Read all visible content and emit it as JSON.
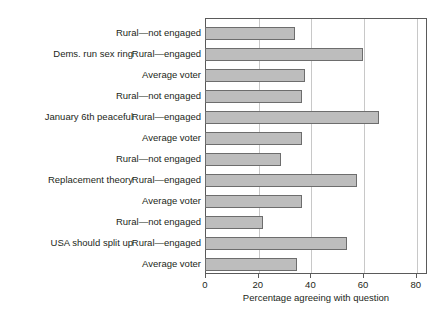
{
  "chart_data": {
    "type": "bar",
    "orientation": "horizontal",
    "title": "",
    "xlabel": "Percentage agreeing with question",
    "ylabel": "",
    "xlim": [
      0,
      84
    ],
    "xticks": [
      0,
      20,
      40,
      60,
      80
    ],
    "xtick_labels": [
      "0",
      "20",
      "40",
      "60",
      "80"
    ],
    "grid": "vertical",
    "legend": "none",
    "group_label_order": "top-to-bottom",
    "categories": [
      "Dems. run sex ring",
      "January 6th peaceful",
      "Replacement theory",
      "USA should split up"
    ],
    "subcategories": [
      "Rural—not engaged",
      "Rural—engaged",
      "Average voter"
    ],
    "groups": [
      {
        "label": "Dems. run sex ring",
        "bars": [
          {
            "label": "Rural—not engaged",
            "value": 34
          },
          {
            "label": "Rural—engaged",
            "value": 60
          },
          {
            "label": "Average voter",
            "value": 38
          }
        ]
      },
      {
        "label": "January 6th peaceful",
        "bars": [
          {
            "label": "Rural—not engaged",
            "value": 37
          },
          {
            "label": "Rural—engaged",
            "value": 66
          },
          {
            "label": "Average voter",
            "value": 37
          }
        ]
      },
      {
        "label": "Replacement theory",
        "bars": [
          {
            "label": "Rural—not engaged",
            "value": 29
          },
          {
            "label": "Rural—engaged",
            "value": 57.5
          },
          {
            "label": "Average voter",
            "value": 37
          }
        ]
      },
      {
        "label": "USA should split up",
        "bars": [
          {
            "label": "Rural—not engaged",
            "value": 22
          },
          {
            "label": "Rural—engaged",
            "value": 54
          },
          {
            "label": "Average voter",
            "value": 35
          }
        ]
      }
    ],
    "colors": {
      "bar_fill": "#bdbdbd",
      "bar_border": "#6d6d6d",
      "gridline": "#c8c8c8",
      "frame": "#5a5a5a",
      "text": "#231f20",
      "background": "#ffffff"
    }
  }
}
